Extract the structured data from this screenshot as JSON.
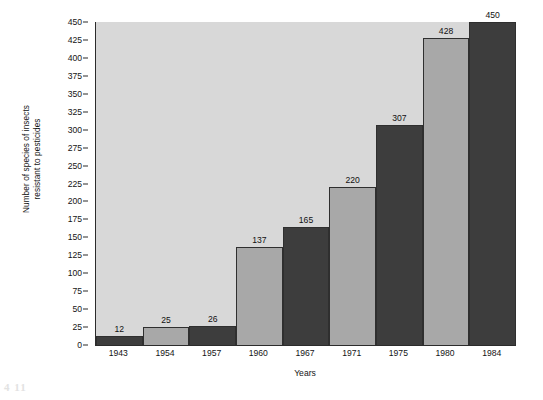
{
  "chart_data": {
    "type": "bar",
    "title": "",
    "subtitle": "",
    "xlabel": "Years",
    "ylabel": "Number of species of insects\nresistant to pesticides",
    "categories": [
      "1943",
      "1954",
      "1957",
      "1960",
      "1967",
      "1971",
      "1975",
      "1980",
      "1984"
    ],
    "values": [
      12,
      25,
      26,
      137,
      165,
      220,
      307,
      428,
      450
    ],
    "value_labels": [
      "12",
      "25",
      "26",
      "137",
      "165",
      "220",
      "307",
      "428",
      "450"
    ],
    "ylim": [
      0,
      450
    ],
    "yticks": [
      0,
      25,
      50,
      75,
      100,
      125,
      150,
      175,
      200,
      225,
      250,
      275,
      300,
      325,
      350,
      375,
      400,
      425,
      450
    ],
    "ytick_labels": [
      "0",
      "25",
      "50",
      "75",
      "100",
      "125",
      "150",
      "175",
      "200",
      "225",
      "250",
      "275",
      "300",
      "325",
      "350",
      "375",
      "400",
      "425",
      "450"
    ],
    "grid": false,
    "legend": null,
    "bar_colors": [
      "dark",
      "light",
      "dark",
      "light",
      "dark",
      "light",
      "dark",
      "light",
      "dark"
    ],
    "colors": {
      "bar_dark": "#3d3d3d",
      "bar_light": "#a8a8a8",
      "plot_background": "#d8d8d8",
      "axis": "#2b2b2b",
      "text": "#141414",
      "page_background": "#ffffff"
    }
  },
  "artifact": {
    "corner_mark": "4 11"
  }
}
